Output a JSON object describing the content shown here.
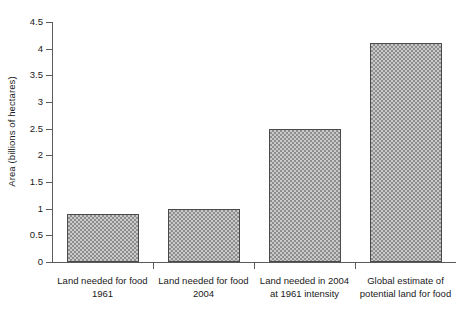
{
  "chart_data": {
    "type": "bar",
    "title": "",
    "xlabel": "",
    "ylabel": "Area (billions of hectares)",
    "ylim": [
      0,
      4.5
    ],
    "grid": false,
    "legend": "none",
    "y_ticks": [
      "0",
      "0.5",
      "1",
      "1.5",
      "2",
      "2.5",
      "3",
      "3.5",
      "4",
      "4.5"
    ],
    "y_tick_values": [
      0,
      0.5,
      1,
      1.5,
      2,
      2.5,
      3,
      3.5,
      4,
      4.5
    ],
    "categories": [
      "Land needed for food 1961",
      "Land needed for food 2004",
      "Land needed in 2004 at 1961 intensity",
      "Global estimate of potential land for food"
    ],
    "category_lines": [
      [
        "Land needed for food",
        "1961"
      ],
      [
        "Land needed for food",
        "2004"
      ],
      [
        "Land needed in 2004",
        "at 1961 intensity"
      ],
      [
        "Global estimate of",
        "potential land for food"
      ]
    ],
    "values": [
      0.9,
      1.0,
      2.5,
      4.1
    ],
    "bar_fill": "#c9c9c9",
    "bar_pattern": "checkerboard-gray",
    "bar_border": "#4a4a4a",
    "axis_color": "#5b5b5b"
  }
}
